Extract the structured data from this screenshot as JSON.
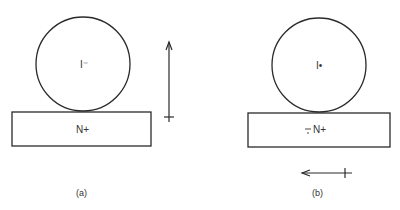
{
  "panels": [
    {
      "id": "a",
      "caption": "(a)",
      "sphere_label": "I⁻",
      "substrate_label": "N+",
      "arrow_direction": "up",
      "sphere": {
        "cx": 83,
        "cy": 64,
        "r": 47
      },
      "substrate": {
        "x": 12,
        "y": 112,
        "width": 139,
        "height": 34
      },
      "arrow": {
        "x1": 169,
        "y1": 117,
        "x2": 169,
        "y2": 42
      }
    },
    {
      "id": "b",
      "caption": "(b)",
      "sphere_label": "I•",
      "substrate_label": "N+",
      "substrate_prefix": "−̣",
      "arrow_direction": "left",
      "sphere": {
        "cx": 319,
        "cy": 65,
        "r": 47
      },
      "substrate": {
        "x": 248,
        "y": 113,
        "width": 142,
        "height": 34
      },
      "arrow": {
        "x1": 352,
        "y1": 173,
        "x2": 302,
        "y2": 173
      }
    }
  ],
  "colors": {
    "stroke": "#2a2a2a",
    "text": "#333333",
    "background": "#ffffff"
  }
}
